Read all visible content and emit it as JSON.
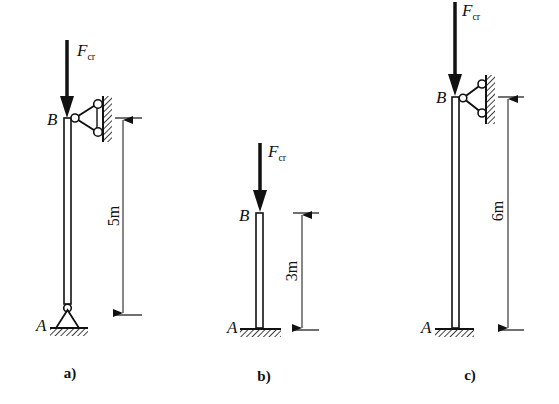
{
  "figures": [
    {
      "id": "a",
      "caption": "a)",
      "force_label": "F",
      "force_subscript": "cr",
      "top_label": "B",
      "bottom_label": "A",
      "length_label": "5m",
      "top_support": "pinned link (roller) to wall",
      "bottom_support": "pin"
    },
    {
      "id": "b",
      "caption": "b)",
      "force_label": "F",
      "force_subscript": "cr",
      "top_label": "B",
      "bottom_label": "A",
      "length_label": "3m",
      "top_support": "free",
      "bottom_support": "fixed"
    },
    {
      "id": "c",
      "caption": "c)",
      "force_label": "F",
      "force_subscript": "cr",
      "top_label": "B",
      "bottom_label": "A",
      "length_label": "6m",
      "top_support": "pinned link (roller) to wall",
      "bottom_support": "fixed"
    }
  ],
  "colors": {
    "ink": "#111111",
    "background": "#ffffff"
  }
}
